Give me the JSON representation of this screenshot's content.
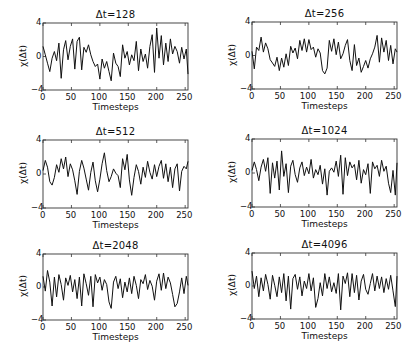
{
  "figure": {
    "layout": "3 rows x 2 columns grid of line plots",
    "xlabel": "Timesteps",
    "ylabel": "χ(Δt)",
    "xticks": [
      "0",
      "50",
      "100",
      "150",
      "200",
      "250"
    ],
    "yticks": [
      "4",
      "0",
      "−4"
    ]
  },
  "chart_data": [
    {
      "type": "line",
      "title": "Δt=128",
      "xlabel": "Timesteps",
      "ylabel": "χ(Δt)",
      "xlim": [
        0,
        255
      ],
      "ylim": [
        -4,
        4
      ],
      "xticks": [
        0,
        50,
        100,
        150,
        200,
        250
      ],
      "yticks": [
        -4,
        0,
        4
      ],
      "grid": false,
      "x_step": 4,
      "values": [
        1.2,
        0.2,
        -0.8,
        -1.8,
        -0.2,
        0.6,
        -0.5,
        1.6,
        -2.6,
        0.8,
        1.9,
        -0.4,
        1.2,
        2.1,
        -1.5,
        1.8,
        2.3,
        -1.6,
        1.1,
        0.5,
        1.4,
        0.2,
        -0.6,
        -1.2,
        -0.9,
        -2.7,
        -0.3,
        -1.4,
        -0.6,
        -1.8,
        -2.9,
        0.4,
        -0.8,
        -1.2,
        -2.4,
        1.4,
        -0.2,
        0.6,
        -1.0,
        0.2,
        -0.5,
        1.8,
        -1.7,
        0.9,
        -0.6,
        0.3,
        -1.4,
        1.2,
        2.6,
        -1.9,
        3.4,
        -0.2,
        2.5,
        -1.0,
        1.6,
        -0.6,
        2.1,
        0.3,
        1.2,
        0.6,
        -0.8,
        1.1,
        -0.3,
        0.9,
        -2.1
      ]
    },
    {
      "type": "line",
      "title": "Δt=256",
      "xlabel": "Timesteps",
      "ylabel": "χ(Δt)",
      "xlim": [
        0,
        255
      ],
      "ylim": [
        -4,
        4
      ],
      "xticks": [
        0,
        50,
        100,
        150,
        200,
        250
      ],
      "yticks": [
        -4,
        0,
        4
      ],
      "grid": false,
      "x_step": 4,
      "values": [
        0.5,
        -1.6,
        1.0,
        0.6,
        2.2,
        0.4,
        1.5,
        0.8,
        -0.5,
        -0.9,
        -1.3,
        -0.2,
        -1.8,
        -0.3,
        -1.4,
        0.2,
        -1.2,
        1.1,
        0.3,
        0.9,
        -0.4,
        1.8,
        0.6,
        2.0,
        0.4,
        1.9,
        0.7,
        1.0,
        -0.2,
        0.8,
        0.3,
        -1.8,
        -2.2,
        -1.5,
        1.8,
        0.5,
        2.0,
        0.1,
        1.6,
        -0.4,
        0.2,
        1.2,
        1.9,
        -0.6,
        -1.8,
        1.3,
        -1.2,
        -0.3,
        -2.0,
        -1.3,
        -0.6,
        -1.5,
        -0.4,
        0.2,
        1.0,
        2.4,
        -0.8,
        2.1,
        0.4,
        1.8,
        -0.6,
        1.2,
        -1.0,
        0.8,
        0.4
      ]
    },
    {
      "type": "line",
      "title": "Δt=512",
      "xlabel": "Timesteps",
      "ylabel": "χ(Δt)",
      "xlim": [
        0,
        255
      ],
      "ylim": [
        -4,
        4
      ],
      "xticks": [
        0,
        50,
        100,
        150,
        200,
        250
      ],
      "yticks": [
        -4,
        0,
        4
      ],
      "grid": false,
      "x_step": 4,
      "values": [
        0.4,
        1.6,
        0.8,
        -0.9,
        -1.3,
        -0.4,
        1.1,
        0.2,
        1.8,
        0.6,
        2.0,
        -0.3,
        1.2,
        0.5,
        -0.8,
        -2.4,
        0.3,
        1.6,
        0.7,
        -0.6,
        -1.9,
        0.2,
        1.4,
        -0.8,
        -2.1,
        -0.6,
        1.2,
        2.5,
        0.4,
        -0.9,
        -0.3,
        0.6,
        0.1,
        -0.2,
        -1.6,
        1.8,
        0.5,
        2.3,
        -0.7,
        -2.5,
        -0.4,
        1.1,
        0.3,
        -1.2,
        0.8,
        -0.4,
        1.5,
        0.2,
        -0.6,
        1.1,
        -0.3,
        0.9,
        1.6,
        -0.5,
        1.2,
        -0.9,
        0.8,
        -1.6,
        0.6,
        1.2,
        -2.0,
        0.3,
        0.9,
        0.6,
        1.5
      ]
    },
    {
      "type": "line",
      "title": "Δt=1024",
      "xlabel": "Timesteps",
      "ylabel": "χ(Δt)",
      "xlim": [
        0,
        255
      ],
      "ylim": [
        -4,
        4
      ],
      "xticks": [
        0,
        50,
        100,
        150,
        200,
        250
      ],
      "yticks": [
        -4,
        0,
        4
      ],
      "grid": false,
      "x_step": 4,
      "values": [
        0.3,
        1.3,
        0.4,
        -0.9,
        0.7,
        1.6,
        0.2,
        1.8,
        -2.4,
        1.2,
        -0.6,
        1.4,
        -2.0,
        2.6,
        -0.4,
        1.1,
        -2.3,
        0.8,
        1.5,
        -0.2,
        -1.1,
        0.6,
        1.3,
        -0.3,
        0.7,
        -0.1,
        1.6,
        -0.6,
        0.4,
        -0.2,
        0.9,
        -1.3,
        0.5,
        -2.6,
        0.2,
        0.6,
        0.1,
        1.4,
        -0.4,
        2.1,
        -2.5,
        1.8,
        -0.3,
        1.3,
        0.6,
        1.0,
        -0.8,
        1.5,
        -1.2,
        0.4,
        -0.2,
        1.1,
        -2.4,
        1.3,
        0.5,
        0.9,
        -0.4,
        1.5,
        0.2,
        0.8,
        -1.2,
        -2.3,
        0.3,
        -2.6,
        1.2
      ]
    },
    {
      "type": "line",
      "title": "Δt=2048",
      "xlabel": "Timesteps",
      "ylabel": "χ(Δt)",
      "xlim": [
        0,
        255
      ],
      "ylim": [
        -4,
        4
      ],
      "xticks": [
        0,
        50,
        100,
        150,
        200,
        250
      ],
      "yticks": [
        -4,
        0,
        4
      ],
      "grid": false,
      "x_step": 4,
      "values": [
        1.3,
        -0.5,
        2.0,
        0.6,
        -2.3,
        1.2,
        -1.2,
        1.5,
        0.3,
        -1.6,
        1.1,
        0.2,
        1.4,
        -0.6,
        0.9,
        -1.4,
        1.2,
        -2.3,
        1.6,
        0.4,
        -1.0,
        1.3,
        -2.4,
        1.5,
        0.5,
        1.2,
        -0.4,
        0.9,
        0.3,
        -1.8,
        -2.6,
        0.6,
        1.3,
        -0.2,
        1.0,
        -1.3,
        0.6,
        -0.6,
        1.1,
        -0.8,
        1.3,
        0.2,
        -1.4,
        0.9,
        0.4,
        1.5,
        -0.3,
        0.8,
        0.1,
        -1.6,
        0.7,
        1.6,
        -0.4,
        1.7,
        -0.2,
        1.2,
        0.5,
        -0.9,
        -2.4,
        -2.0,
        -0.6,
        1.1,
        -0.8,
        1.3,
        0.2
      ]
    },
    {
      "type": "line",
      "title": "Δt=4096",
      "xlabel": "Timesteps",
      "ylabel": "χ(Δt)",
      "xlim": [
        0,
        255
      ],
      "ylim": [
        -4,
        4
      ],
      "xticks": [
        0,
        50,
        100,
        150,
        200,
        250
      ],
      "yticks": [
        -4,
        0,
        4
      ],
      "grid": false,
      "x_step": 4,
      "values": [
        1.8,
        -0.3,
        1.2,
        -1.3,
        1.0,
        -0.6,
        1.4,
        0.2,
        -1.6,
        1.3,
        0.1,
        -1.3,
        1.1,
        -0.8,
        1.5,
        -1.8,
        1.2,
        -2.8,
        0.9,
        1.4,
        -0.4,
        1.1,
        -1.2,
        0.6,
        -0.3,
        1.5,
        -0.6,
        1.0,
        -2.6,
        -1.5,
        0.4,
        -1.2,
        1.5,
        -0.3,
        1.1,
        -0.7,
        0.4,
        -0.9,
        1.5,
        -2.9,
        1.2,
        0.3,
        1.6,
        -1.3,
        1.5,
        -0.8,
        1.3,
        -1.7,
        0.6,
        1.4,
        -0.4,
        -1.0,
        0.3,
        1.5,
        -0.6,
        1.2,
        -0.3,
        1.1,
        -0.8,
        0.9,
        -0.4,
        1.3,
        -0.6,
        -2.5,
        1.2
      ]
    }
  ]
}
